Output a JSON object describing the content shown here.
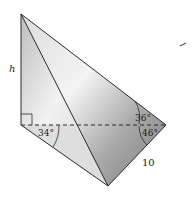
{
  "figure": {
    "type": "3D pyramid / tetrahedron geometry diagram",
    "labels": {
      "height": "h",
      "angle_left": "34°",
      "angle_upper_right": "36°",
      "angle_lower_right": "46°",
      "side_length": "10"
    },
    "points": {
      "apex": [
        21,
        14
      ],
      "base_corner_right_angle": [
        21,
        125
      ],
      "right_vertex": [
        166,
        125
      ],
      "bottom_vertex": [
        108,
        186
      ]
    },
    "colors": {
      "stroke": "#2a2a2a",
      "face_light": "#e8e8e8",
      "face_mid": "#c4c4c4",
      "face_dark": "#8f8f8f",
      "background": "#ffffff"
    }
  }
}
